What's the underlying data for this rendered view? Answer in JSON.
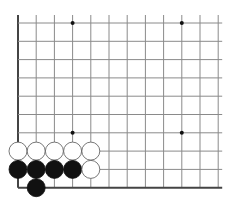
{
  "board": {
    "description": "Go problem diagram, lower-left corner of board",
    "colors": {
      "line": "#8a8a8a",
      "edge": "#444444",
      "black": "#111111",
      "white": "#ffffff",
      "stone_outline": "#555555",
      "star": "#111111"
    },
    "grid": {
      "x": [
        18,
        36.2,
        54.4,
        72.6,
        90.8,
        109,
        127.2,
        145.4,
        163.6,
        181.8,
        200,
        218.2
      ],
      "y": [
        23,
        41.3,
        59.6,
        77.9,
        96.2,
        114.5,
        132.8,
        151.1,
        169.4,
        187.7
      ],
      "left_edge": true,
      "bottom_edge": true,
      "extend_top": 8,
      "extend_right": 4
    },
    "star_points": [
      [
        3,
        0
      ],
      [
        9,
        0
      ],
      [
        3,
        6
      ],
      [
        9,
        6
      ]
    ],
    "stones": [
      {
        "color": "white",
        "col": 0,
        "row": 7
      },
      {
        "color": "white",
        "col": 1,
        "row": 7
      },
      {
        "color": "white",
        "col": 2,
        "row": 7
      },
      {
        "color": "white",
        "col": 3,
        "row": 7
      },
      {
        "color": "white",
        "col": 4,
        "row": 7
      },
      {
        "color": "black",
        "col": 0,
        "row": 8
      },
      {
        "color": "black",
        "col": 1,
        "row": 8
      },
      {
        "color": "black",
        "col": 2,
        "row": 8
      },
      {
        "color": "black",
        "col": 3,
        "row": 8
      },
      {
        "color": "white",
        "col": 4,
        "row": 8
      },
      {
        "color": "black",
        "col": 1,
        "row": 9
      }
    ],
    "stone_radius": 9
  }
}
